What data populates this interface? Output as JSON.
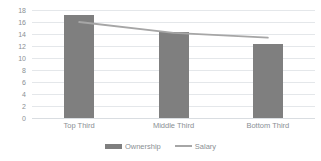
{
  "chart_data": {
    "type": "bar",
    "title": "",
    "subtitle": "",
    "xlabel": "",
    "ylabel": "",
    "categories": [
      "Top Third",
      "Middle Third",
      "Bottom Third"
    ],
    "series": [
      {
        "name": "Ownership",
        "type": "bar",
        "values": [
          17.2,
          14.4,
          12.3
        ],
        "color": "#7f7f7f"
      },
      {
        "name": "Salary",
        "type": "line",
        "values": [
          16.0,
          14.2,
          13.4
        ],
        "color": "#a6a6a6"
      }
    ],
    "ylim": [
      0,
      18
    ],
    "ytick_labels": [
      "18",
      "16",
      "14",
      "12",
      "10",
      "8",
      "6",
      "4",
      "2",
      "0"
    ],
    "ytick_values": [
      18,
      16,
      14,
      12,
      10,
      8,
      6,
      4,
      2,
      0
    ],
    "grid": true,
    "grid_color": "#e4e7ea",
    "legend_position": "bottom",
    "axis_text_color": "#8a8f94",
    "background_color": "#ffffff"
  },
  "legend": {
    "items": [
      {
        "label": "Ownership",
        "marker": "bar-swatch-icon"
      },
      {
        "label": "Salary",
        "marker": "line-swatch-icon"
      }
    ]
  }
}
